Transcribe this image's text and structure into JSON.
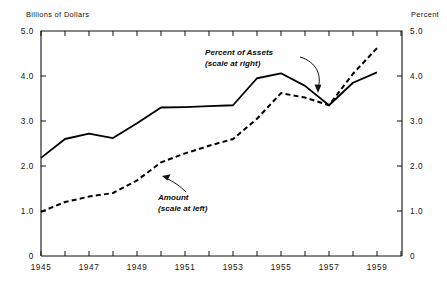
{
  "chart_data": {
    "type": "line",
    "title": "",
    "xlabel": "",
    "ylabel": "Billions of Dollars",
    "y2label": "Percent",
    "xlim": [
      1945,
      1960
    ],
    "ylim": [
      0,
      5.0
    ],
    "y2lim": [
      0,
      5.0
    ],
    "grid": false,
    "legend_position": "inline-annotations",
    "x_tick_labels": [
      "1945",
      "1947",
      "1949",
      "1951",
      "1953",
      "1955",
      "1957",
      "1959"
    ],
    "x_tick_values": [
      1945,
      1947,
      1949,
      1951,
      1953,
      1955,
      1957,
      1959
    ],
    "x_minor_tick_values": [
      1946,
      1948,
      1950,
      1952,
      1954,
      1956,
      1958,
      1959.5
    ],
    "y_tick_labels": [
      "5.0",
      "4.0",
      "3.0",
      "2.0",
      "1.0",
      "0"
    ],
    "y_tick_values": [
      5.0,
      4.0,
      3.0,
      2.0,
      1.0,
      0
    ],
    "y2_tick_labels": [
      "5.0",
      "4.0",
      "3.0",
      "2.0",
      "1.0",
      "0"
    ],
    "y2_tick_values": [
      5.0,
      4.0,
      3.0,
      2.0,
      1.0,
      0
    ],
    "x": [
      1945,
      1946,
      1947,
      1948,
      1949,
      1950,
      1951,
      1952,
      1953,
      1954,
      1955,
      1956,
      1957,
      1958,
      1959
    ],
    "series": [
      {
        "name": "Percent of Assets",
        "style": "solid",
        "axis": "right",
        "color": "#000000",
        "values": [
          2.18,
          2.6,
          2.72,
          2.62,
          2.95,
          3.3,
          3.31,
          3.33,
          3.35,
          3.95,
          4.06,
          3.78,
          3.35,
          3.85,
          4.08
        ]
      },
      {
        "name": "Amount",
        "style": "dashed",
        "axis": "left",
        "color": "#000000",
        "values": [
          0.98,
          1.2,
          1.32,
          1.4,
          1.68,
          2.08,
          2.28,
          2.45,
          2.6,
          3.05,
          3.62,
          3.52,
          3.35,
          4.05,
          4.62
        ]
      }
    ],
    "annotations": [
      {
        "id": "percent-of-assets",
        "line1": "Percent of Assets",
        "line2": "(scale at right)",
        "points_to_series": "Percent of Assets"
      },
      {
        "id": "amount",
        "line1": "Amount",
        "line2": "(scale at left)",
        "points_to_series": "Amount"
      }
    ]
  },
  "axes": {
    "left_title": "Billions of Dollars",
    "right_title": "Percent"
  }
}
